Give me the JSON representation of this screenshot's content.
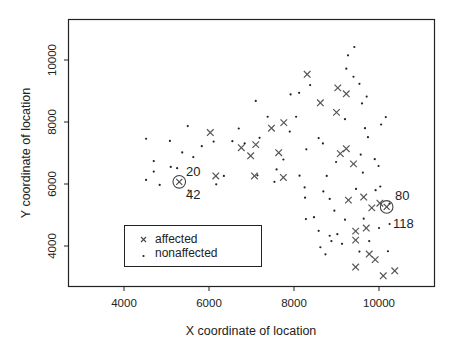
{
  "chart_data": {
    "type": "scatter",
    "title": "",
    "xlabel": "X coordinate of location",
    "ylabel": "Y coordinate of location",
    "xlim": [
      2950,
      11550
    ],
    "ylim": [
      2650,
      11300
    ],
    "xticks": [
      4000,
      6000,
      8000,
      10000
    ],
    "yticks": [
      4000,
      6000,
      8000,
      10000
    ],
    "xtick_labels": [
      "4000",
      "6000",
      "8000",
      "10000"
    ],
    "ytick_labels": [
      "4000",
      "6000",
      "8000",
      "10000"
    ],
    "grid": false,
    "legend": {
      "position": "bottom-left",
      "entries": [
        {
          "symbol": "x",
          "label": "affected"
        },
        {
          "symbol": ".",
          "label": "nonaffected"
        }
      ]
    },
    "series": [
      {
        "name": "affected",
        "marker": "x",
        "points": [
          [
            6030,
            7660
          ],
          [
            6760,
            7170
          ],
          [
            6980,
            6910
          ],
          [
            7100,
            7270
          ],
          [
            7070,
            6260
          ],
          [
            7470,
            7800
          ],
          [
            7640,
            7010
          ],
          [
            7750,
            6210
          ],
          [
            7760,
            7980
          ],
          [
            6160,
            6260
          ],
          [
            8310,
            9540
          ],
          [
            8620,
            8620
          ],
          [
            9030,
            9100
          ],
          [
            9230,
            8910
          ],
          [
            9000,
            8310
          ],
          [
            9090,
            6980
          ],
          [
            9230,
            7140
          ],
          [
            9400,
            6650
          ],
          [
            9280,
            5480
          ],
          [
            9450,
            4480
          ],
          [
            9450,
            4190
          ],
          [
            9640,
            5580
          ],
          [
            9700,
            4580
          ],
          [
            9830,
            5230
          ],
          [
            10020,
            5380
          ],
          [
            9910,
            3560
          ],
          [
            9770,
            3740
          ],
          [
            9450,
            3320
          ],
          [
            10370,
            3200
          ],
          [
            10100,
            3040
          ]
        ]
      },
      {
        "name": "nonaffected",
        "marker": ".",
        "points": [
          [
            4520,
            7460
          ],
          [
            4700,
            6740
          ],
          [
            4700,
            6400
          ],
          [
            4520,
            6130
          ],
          [
            4840,
            5970
          ],
          [
            5080,
            7390
          ],
          [
            5100,
            6550
          ],
          [
            5250,
            6510
          ],
          [
            5370,
            7020
          ],
          [
            5500,
            7870
          ],
          [
            5630,
            6870
          ],
          [
            5520,
            5790
          ],
          [
            5830,
            7220
          ],
          [
            6110,
            7370
          ],
          [
            6350,
            6260
          ],
          [
            6170,
            5990
          ],
          [
            6550,
            7380
          ],
          [
            6700,
            7790
          ],
          [
            6840,
            7310
          ],
          [
            7100,
            8680
          ],
          [
            7190,
            7490
          ],
          [
            7140,
            6280
          ],
          [
            7380,
            8170
          ],
          [
            7540,
            6070
          ],
          [
            7590,
            6470
          ],
          [
            7750,
            6790
          ],
          [
            7900,
            7690
          ],
          [
            7920,
            8890
          ],
          [
            8120,
            8940
          ],
          [
            8050,
            8170
          ],
          [
            8250,
            5890
          ],
          [
            8290,
            7120
          ],
          [
            8130,
            6270
          ],
          [
            8260,
            5560
          ],
          [
            8280,
            4870
          ],
          [
            8470,
            4930
          ],
          [
            8580,
            4490
          ],
          [
            8620,
            3960
          ],
          [
            8740,
            3730
          ],
          [
            8840,
            4330
          ],
          [
            8380,
            9190
          ],
          [
            8580,
            7480
          ],
          [
            8680,
            7310
          ],
          [
            8770,
            6260
          ],
          [
            8690,
            5760
          ],
          [
            8990,
            6710
          ],
          [
            8840,
            5520
          ],
          [
            8950,
            5140
          ],
          [
            9020,
            4380
          ],
          [
            9130,
            4070
          ],
          [
            9200,
            8090
          ],
          [
            9230,
            9720
          ],
          [
            9270,
            10150
          ],
          [
            9420,
            10420
          ],
          [
            9400,
            9460
          ],
          [
            9540,
            9230
          ],
          [
            9600,
            8600
          ],
          [
            9710,
            8820
          ],
          [
            9670,
            7800
          ],
          [
            9740,
            7510
          ],
          [
            9570,
            6950
          ],
          [
            9620,
            6370
          ],
          [
            9900,
            6800
          ],
          [
            9990,
            6580
          ],
          [
            10050,
            7920
          ],
          [
            10160,
            8160
          ],
          [
            9920,
            5800
          ],
          [
            10030,
            5920
          ],
          [
            10250,
            5370
          ],
          [
            10250,
            4710
          ],
          [
            10210,
            3830
          ],
          [
            10000,
            4580
          ],
          [
            9770,
            4160
          ],
          [
            9540,
            3820
          ],
          [
            9640,
            4880
          ],
          [
            9200,
            4850
          ],
          [
            9460,
            5840
          ],
          [
            8880,
            4160
          ]
        ]
      }
    ],
    "highlighted": [
      {
        "marker": "circled-x",
        "x": 5300,
        "y": 6070,
        "labels": [
          "20",
          "42"
        ]
      },
      {
        "marker": "circled-x",
        "x": 10180,
        "y": 5260,
        "labels": [
          "80",
          "118"
        ]
      }
    ]
  },
  "annotations": {
    "a20": "20",
    "a42": "42",
    "a80": "80",
    "a118": "118"
  },
  "colors": {
    "frame": "#222222",
    "affected": "#555555",
    "nonaffected": "#222222"
  }
}
